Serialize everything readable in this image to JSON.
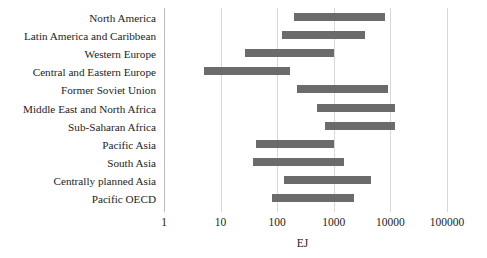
{
  "chart_data": {
    "type": "bar",
    "orientation": "horizontal",
    "subtype": "range-bar",
    "title": "",
    "xlabel": "EJ",
    "ylabel": "",
    "xscale": "log",
    "xlim": [
      1,
      100000
    ],
    "xticks": [
      1,
      10,
      100,
      1000,
      10000,
      100000
    ],
    "xticklabels": [
      "1",
      "10",
      "100",
      "1000",
      "10000",
      "100000"
    ],
    "grid": true,
    "grid_axis": "x",
    "legend": false,
    "bar_color": "#6b6b6b",
    "categories": [
      "North America",
      "Latin America and Caribbean",
      "Western Europe",
      "Central and Eastern Europe",
      "Former Soviet Union",
      "Middle East and North Africa",
      "Sub-Saharan Africa",
      "Pacific Asia",
      "South Asia",
      "Centrally planned Asia",
      "Pacific OECD"
    ],
    "ranges": [
      {
        "category": "North America",
        "low": 200,
        "high": 8000
      },
      {
        "category": "Latin America and Caribbean",
        "low": 120,
        "high": 3500
      },
      {
        "category": "Western Europe",
        "low": 27,
        "high": 1000
      },
      {
        "category": "Central and Eastern Europe",
        "low": 5,
        "high": 170
      },
      {
        "category": "Former Soviet Union",
        "low": 220,
        "high": 9000
      },
      {
        "category": "Middle East and North Africa",
        "low": 500,
        "high": 12000
      },
      {
        "category": "Sub-Saharan Africa",
        "low": 700,
        "high": 12000
      },
      {
        "category": "Pacific Asia",
        "low": 42,
        "high": 1000
      },
      {
        "category": "South Asia",
        "low": 37,
        "high": 1500
      },
      {
        "category": "Centrally planned Asia",
        "low": 130,
        "high": 4500
      },
      {
        "category": "Pacific OECD",
        "low": 80,
        "high": 2300
      }
    ]
  }
}
